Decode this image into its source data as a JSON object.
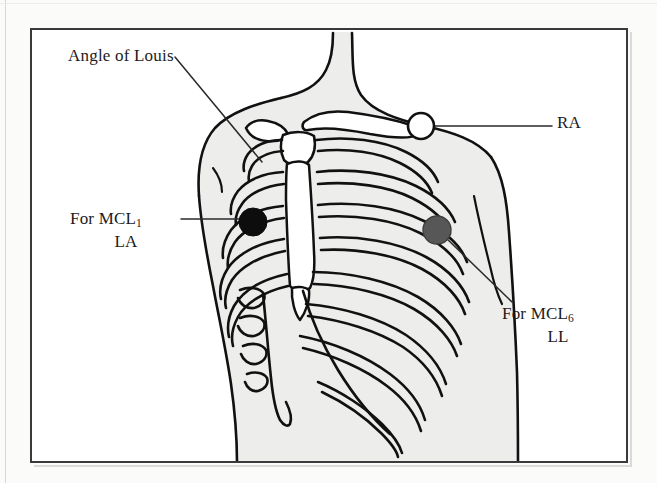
{
  "figure": {
    "background_color": "#ffffff",
    "frame_color": "#3a3a3c",
    "body_fill_color": "#ededec",
    "bone_outline_color": "#111111"
  },
  "labels": {
    "angle_of_louis": {
      "text": "Angle of Louis",
      "leader": "diagonal line to sternal angle"
    },
    "mcl1": {
      "line1_prefix": "For MCL",
      "line1_subscript": "1",
      "line2": "LA",
      "leader": "horizontal line to black electrode"
    },
    "mcl6": {
      "line1_prefix": "For MCL",
      "line1_subscript": "6",
      "line2": "LL",
      "leader": "diagonal line to gray electrode"
    },
    "ra": {
      "text": "RA",
      "leader": "horizontal line to white electrode"
    }
  },
  "electrodes": [
    {
      "id": "la",
      "label": "LA",
      "lead": "MCL1",
      "fill": "#0d0d0d",
      "stroke": "#0d0d0d",
      "cx": 253,
      "cy": 222,
      "r": 14,
      "description": "black filled circle at right 4th intercostal space beside sternum"
    },
    {
      "id": "ll",
      "label": "LL",
      "lead": "MCL6",
      "fill": "#575757",
      "stroke": "#3f3f3f",
      "cx": 437,
      "cy": 230,
      "r": 14,
      "description": "gray filled circle at left midaxillary line"
    },
    {
      "id": "ra",
      "label": "RA",
      "lead": "RA",
      "fill": "#ffffff",
      "stroke": "#111111",
      "cx": 421,
      "cy": 126,
      "r": 13,
      "description": "white open circle below left clavicle at shoulder"
    }
  ],
  "anatomy": {
    "parts": [
      "neck",
      "right-shoulder",
      "left-shoulder",
      "torso-outline",
      "clavicles",
      "manubrium",
      "sternum-body",
      "xiphoid-process",
      "ribs-right",
      "ribs-left",
      "costal-cartilage",
      "costal-margin"
    ],
    "rib_pair_count": 10
  }
}
